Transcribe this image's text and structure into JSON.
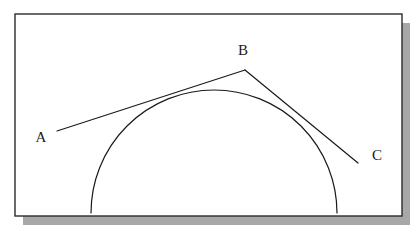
{
  "figure": {
    "name": "tangent-lines-to-semicircle",
    "canvas": {
      "width": 420,
      "height": 234
    },
    "background_color": "#ffffff",
    "frame": {
      "name": "diagram-frame",
      "x": 15,
      "y": 14,
      "width": 387,
      "height": 202,
      "stroke_color": "#2b2b2b",
      "stroke_width": 1.4,
      "fill_color": "#ffffff",
      "shadow": {
        "color": "#a8a8a8",
        "offset_x": 8,
        "offset_y": 9
      }
    },
    "stroke_color": "#1a1a1a",
    "stroke_width": 1.2,
    "semicircle": {
      "name": "semicircle-arc",
      "center_x": 214,
      "center_y": 213,
      "radius": 123,
      "start_angle_deg": 180,
      "end_angle_deg": 0,
      "baseline_y": 213
    },
    "segments": [
      {
        "name": "segment-ab",
        "from": "A",
        "to": "B",
        "x1": 57,
        "y1": 131,
        "x2": 245,
        "y2": 70
      },
      {
        "name": "segment-bc",
        "from": "B",
        "to": "C",
        "x1": 245,
        "y1": 70,
        "x2": 358,
        "y2": 163
      }
    ],
    "labels": [
      {
        "name": "label-a",
        "text": "A",
        "x": 41,
        "y": 142
      },
      {
        "name": "label-b",
        "text": "B",
        "x": 243,
        "y": 55
      },
      {
        "name": "label-c",
        "text": "C",
        "x": 377,
        "y": 160
      }
    ]
  }
}
